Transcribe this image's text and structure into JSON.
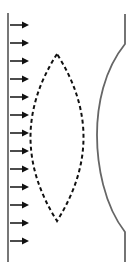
{
  "diagram": {
    "colors": {
      "background": "#ffffff",
      "wall": "#555555",
      "arrows": "#111111",
      "lens_outline": "#111111",
      "wavefront": "#666666"
    },
    "source_wall": {
      "x": 8,
      "y_top": 13,
      "y_bottom": 262
    },
    "arrows": {
      "count": 13,
      "x_start": 10,
      "x_end": 29,
      "y_positions": [
        25,
        43,
        61,
        79,
        97,
        115,
        133,
        151,
        169,
        187,
        205,
        223,
        241
      ]
    },
    "lens": {
      "style": "dashed",
      "top_apex": [
        57,
        54
      ],
      "bottom_apex": [
        57,
        221
      ],
      "left_extent_x": 23,
      "right_extent_x": 91
    },
    "wavefront": {
      "style": "solid",
      "x_flat": 125,
      "y_top": 14,
      "y_bend_top": 44,
      "x_min": 97,
      "y_mid": 135,
      "y_bend_bottom": 232,
      "y_bottom": 262
    }
  }
}
